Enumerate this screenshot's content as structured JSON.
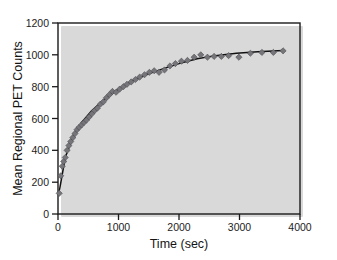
{
  "figure": {
    "background_color": "#ffffff",
    "frame_color": "#1a1a1a",
    "marker_color": "#76767a",
    "line_color": "#111111"
  },
  "chart_data": {
    "type": "scatter",
    "title": "",
    "xlabel": "Time (sec)",
    "ylabel": "Mean Regional PET Counts",
    "xlim": [
      0,
      4000
    ],
    "ylim": [
      0,
      1200
    ],
    "xticks": [
      0,
      1000,
      2000,
      3000,
      4000
    ],
    "xtick_labels": [
      "0",
      "1000",
      "2000",
      "3000",
      "4000"
    ],
    "yticks": [
      0,
      200,
      400,
      600,
      800,
      1000,
      1200
    ],
    "ytick_labels": [
      "0",
      "200",
      "400",
      "600",
      "800",
      "1000",
      "1200"
    ],
    "grid": false,
    "legend": false,
    "series": [
      {
        "name": "Mean regional PET counts",
        "marker": "diamond",
        "color": "#76767a",
        "x": [
          20,
          45,
          70,
          95,
          120,
          150,
          180,
          210,
          245,
          280,
          315,
          350,
          390,
          430,
          470,
          515,
          560,
          605,
          650,
          700,
          750,
          800,
          850,
          900,
          960,
          1020,
          1080,
          1140,
          1210,
          1280,
          1350,
          1430,
          1510,
          1590,
          1670,
          1760,
          1850,
          1940,
          2040,
          2140,
          2250,
          2360,
          2470,
          2580,
          2700,
          2820,
          2990,
          3180,
          3370,
          3560,
          3720
        ],
        "y": [
          130,
          240,
          300,
          330,
          355,
          400,
          430,
          455,
          480,
          505,
          530,
          545,
          560,
          575,
          590,
          610,
          630,
          650,
          665,
          690,
          705,
          730,
          750,
          770,
          765,
          785,
          800,
          815,
          830,
          845,
          860,
          875,
          890,
          900,
          890,
          905,
          930,
          945,
          960,
          965,
          985,
          1000,
          985,
          990,
          990,
          995,
          985,
          1010,
          1015,
          1015,
          1025
        ]
      },
      {
        "name": "Fitted curve",
        "type": "line",
        "color": "#111111",
        "model": "exponential rise to plateau",
        "plateau": 1030,
        "x": [
          20,
          120,
          250,
          400,
          560,
          750,
          960,
          1200,
          1450,
          1720,
          2000,
          2300,
          2600,
          2950,
          3300,
          3720
        ],
        "y": [
          140,
          355,
          490,
          580,
          650,
          715,
          775,
          830,
          875,
          910,
          945,
          975,
          995,
          1010,
          1020,
          1027
        ]
      }
    ]
  }
}
